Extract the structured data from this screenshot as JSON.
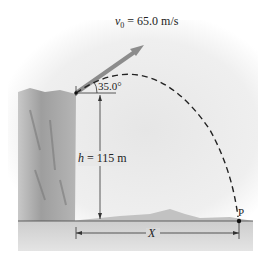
{
  "diagram": {
    "velocity_label": {
      "symbol": "v",
      "subscript": "0",
      "value": " = 65.0 m/s"
    },
    "angle_label": "35.0°",
    "height_label": {
      "symbol": "h",
      "value": " = 115 m"
    },
    "distance_label": "X",
    "landing_point_label": "P",
    "colors": {
      "sky": "#e9e9e9",
      "cliff": "#9a9a9a",
      "ground": "#cfcfcf",
      "arrow": "#8c8c8c",
      "lines": "#333333"
    }
  }
}
